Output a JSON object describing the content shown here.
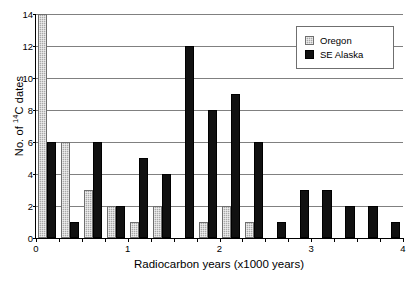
{
  "chart_data": {
    "type": "bar",
    "title": "",
    "subtitle": "",
    "xlabel": "Radiocarbon years (x1000 years)",
    "ylabel": "No. of 14C dates",
    "ylabel_prefix": "No. of ",
    "ylabel_superscript": "14",
    "ylabel_suffix": "C dates",
    "xlim": [
      0,
      4
    ],
    "ylim": [
      0,
      14
    ],
    "grid": true,
    "grid_axis": "y",
    "legend_position": "top-right",
    "bin_width": 0.25,
    "categories": [
      "0.00-0.25",
      "0.25-0.50",
      "0.50-0.75",
      "0.75-1.00",
      "1.00-1.25",
      "1.25-1.50",
      "1.50-1.75",
      "1.75-2.00",
      "2.00-2.25",
      "2.25-2.50",
      "2.50-2.75",
      "2.75-3.00",
      "3.00-3.25",
      "3.25-3.50",
      "3.50-3.75",
      "3.75-4.00"
    ],
    "bin_starts": [
      0,
      0.25,
      0.5,
      0.75,
      1.0,
      1.25,
      1.5,
      1.75,
      2.0,
      2.25,
      2.5,
      2.75,
      3.0,
      3.25,
      3.5,
      3.75
    ],
    "series": [
      {
        "name": "Oregon",
        "color": "#a8a8a8",
        "values": [
          14,
          6,
          3,
          2,
          1,
          2,
          0,
          1,
          2,
          1,
          0,
          0,
          0,
          0,
          0,
          0
        ]
      },
      {
        "name": "SE Alaska",
        "color": "#111111",
        "values": [
          6,
          1,
          6,
          2,
          5,
          4,
          12,
          8,
          9,
          6,
          1,
          3,
          3,
          2,
          2,
          1
        ]
      }
    ],
    "yticks": [
      0,
      2,
      4,
      6,
      8,
      10,
      12,
      14
    ],
    "ytick_labels": [
      "0",
      "2",
      "4",
      "6",
      "8",
      "10",
      "12",
      "14"
    ],
    "xticks": [
      0,
      0.25,
      0.5,
      0.75,
      1,
      1.25,
      1.5,
      1.75,
      2,
      2.25,
      2.5,
      2.75,
      3,
      3.25,
      3.5,
      3.75,
      4
    ],
    "xtick_labels_major": [
      {
        "value": 0,
        "label": "0"
      },
      {
        "value": 1,
        "label": "1"
      },
      {
        "value": 2,
        "label": "2"
      },
      {
        "value": 3,
        "label": "3"
      },
      {
        "value": 4,
        "label": "4"
      }
    ]
  },
  "legend": {
    "items": [
      {
        "label": "Oregon",
        "swatch": "oregon"
      },
      {
        "label": "SE Alaska",
        "swatch": "alaska"
      }
    ]
  }
}
